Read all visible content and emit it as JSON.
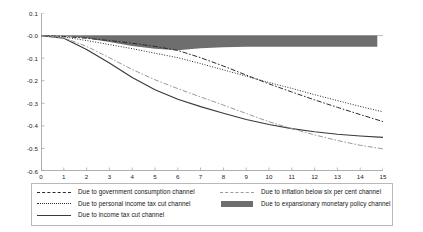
{
  "chart_data": {
    "type": "line",
    "title": "",
    "subtitle": "",
    "xlabel": "",
    "ylabel": "",
    "xlim": [
      0,
      15
    ],
    "ylim": [
      -0.6,
      0.1
    ],
    "grid": false,
    "legend_position": "below",
    "x_tick_labels": [
      "0",
      "1",
      "2",
      "3",
      "4",
      "5",
      "6",
      "7",
      "8",
      "9",
      "10",
      "11",
      "12",
      "13",
      "14",
      "15"
    ],
    "y_tick_labels": [
      "0.1",
      "-0.0",
      "-0.1",
      "-0.2",
      "-0.3",
      "-0.4",
      "-0.5",
      "-0.6"
    ],
    "x": [
      0,
      1,
      2,
      3,
      4,
      5,
      6,
      7,
      8,
      9,
      10,
      11,
      12,
      13,
      14,
      15
    ],
    "series": [
      {
        "name": "Due to government consumption channel",
        "style": "dash-dot",
        "color": "#2b2b2b",
        "values": [
          0.0,
          -0.004,
          -0.012,
          -0.022,
          -0.034,
          -0.048,
          -0.066,
          -0.098,
          -0.135,
          -0.175,
          -0.214,
          -0.25,
          -0.285,
          -0.318,
          -0.35,
          -0.381
        ]
      },
      {
        "name": "Due to personal income tax cut channel",
        "style": "dotted",
        "color": "#2b2b2b",
        "values": [
          0.0,
          -0.006,
          -0.022,
          -0.04,
          -0.058,
          -0.078,
          -0.098,
          -0.124,
          -0.152,
          -0.18,
          -0.208,
          -0.234,
          -0.262,
          -0.288,
          -0.314,
          -0.338
        ]
      },
      {
        "name": "Due to income tax cut channel",
        "style": "solid",
        "color": "#3a3a3a",
        "values": [
          0.0,
          -0.012,
          -0.062,
          -0.122,
          -0.186,
          -0.24,
          -0.282,
          -0.315,
          -0.344,
          -0.372,
          -0.394,
          -0.412,
          -0.426,
          -0.437,
          -0.445,
          -0.451
        ]
      },
      {
        "name": "Due to inflation below six per cent channel",
        "style": "dash-dot",
        "color": "#9a9a9a",
        "values": [
          0.0,
          -0.01,
          -0.048,
          -0.098,
          -0.15,
          -0.196,
          -0.235,
          -0.272,
          -0.308,
          -0.345,
          -0.382,
          -0.412,
          -0.44,
          -0.465,
          -0.486,
          -0.502
        ]
      }
    ],
    "band": {
      "name": "Due to expansionary monetary policy channel",
      "style": "filled-area",
      "color": "#6e6e6e",
      "upper": [
        0.0,
        0.0,
        0.0,
        0.0,
        0.0,
        0.0,
        0.0,
        0.0,
        0.0,
        0.0,
        0.0,
        0.0,
        0.0,
        0.0,
        0.0,
        0.0
      ],
      "lower": [
        0.0,
        -0.002,
        -0.012,
        -0.028,
        -0.046,
        -0.058,
        -0.065,
        -0.056,
        -0.052,
        -0.05,
        -0.05,
        -0.05,
        -0.05,
        -0.05,
        -0.05,
        -0.05
      ],
      "x_end": 14.75
    }
  },
  "legend": {
    "left_column": [
      {
        "label": "Due to government consumption channel",
        "key": "dash-dot-dark"
      },
      {
        "label": "Due to personal income tax cut channel",
        "key": "dotted"
      },
      {
        "label": "Due to income tax cut channel",
        "key": "solid"
      }
    ],
    "right_column": [
      {
        "label": "Due to inflation below six per cent channel",
        "key": "dash-dot-light"
      },
      {
        "label": "Due to expansionary monetary policy channel",
        "key": "swatch"
      }
    ]
  },
  "colors": {
    "band": "#6e6e6e",
    "dark_line": "#2b2b2b",
    "solid_line": "#3a3a3a",
    "light_line": "#9a9a9a",
    "axis": "#9c9c9c",
    "legend_border": "#b9b9b9"
  }
}
